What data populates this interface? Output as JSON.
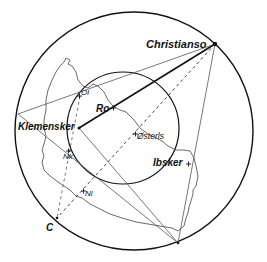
{
  "diagram": {
    "labels": {
      "christianso": "Christianso",
      "ro": "Ro",
      "klemensker": "Klemensker",
      "osterls": "Østerls",
      "ibsker": "Ibsker",
      "nk": "Nk",
      "nl": "Nl",
      "ol": "Ol",
      "c": "C"
    },
    "colors": {
      "line": "#111111",
      "thin_line": "#555555",
      "coast": "#444444"
    }
  }
}
